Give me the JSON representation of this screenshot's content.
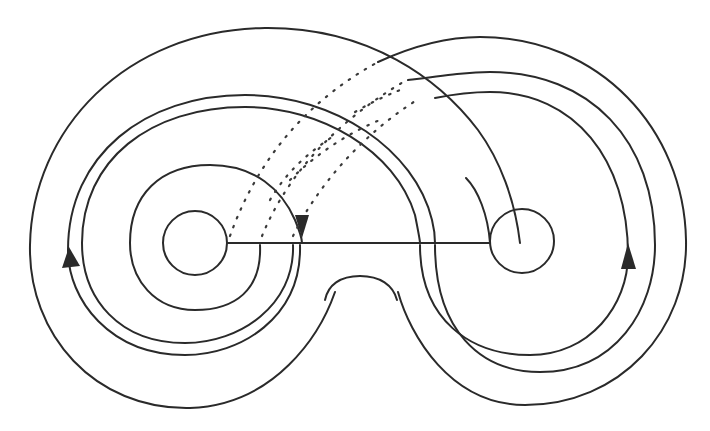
{
  "figure": {
    "colors": {
      "stroke": "#2a2a2a",
      "background": "#ffffff"
    },
    "elements": {
      "outer_boundary": "outer-boundary",
      "left_hole": "left-hole",
      "right_hole": "right-hole",
      "connecting_arc": "horizontal-arc",
      "left_nested_curves": 3,
      "right_nested_curves": 3,
      "dotted_arcs": 6,
      "arrows": 3
    },
    "arrows": [
      {
        "name": "left-arrow",
        "direction": "up"
      },
      {
        "name": "middle-arrow",
        "direction": "down"
      },
      {
        "name": "right-arrow",
        "direction": "up"
      }
    ]
  }
}
